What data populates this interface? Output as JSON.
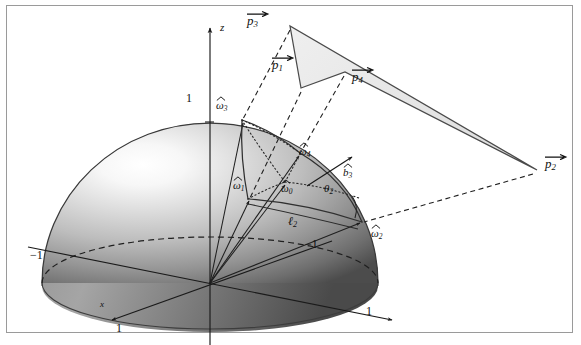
{
  "figure": {
    "kind": "3d-geometry-diagram",
    "border_color": "#9a9a9a",
    "background": "#ffffff",
    "ink_color": "#1a1a1a",
    "sphere": {
      "highlight_color": "#fbfbfb",
      "midtone_color": "#b5b5b5",
      "shadow_color": "#4e4e4e",
      "outline_color": "#3a3a3a"
    },
    "patch": {
      "fill_color": "#e4e4e4",
      "edge_color": "#4a4a4a"
    }
  },
  "axes": {
    "z_label": "z",
    "x_label": "x",
    "ticks": {
      "z_top": "1",
      "x_front": "1",
      "x_back": "−1",
      "y_right": "1",
      "y_left": "−1"
    }
  },
  "labels": {
    "p1": {
      "base": "p",
      "sub": "1",
      "accent": "vec",
      "text": "p⃗1"
    },
    "p2": {
      "base": "p",
      "sub": "2",
      "accent": "vec",
      "text": "p⃗2"
    },
    "p3": {
      "base": "p",
      "sub": "3",
      "accent": "vec",
      "text": "p⃗3"
    },
    "p4": {
      "base": "p",
      "sub": "4",
      "accent": "vec",
      "text": "p⃗4"
    },
    "w0": {
      "base": "ω",
      "sub": "0",
      "accent": "hat",
      "text": "ω̂0"
    },
    "w1": {
      "base": "ω",
      "sub": "1",
      "accent": "hat",
      "text": "ω̂1"
    },
    "w2": {
      "base": "ω",
      "sub": "2",
      "accent": "hat",
      "text": "ω̂2"
    },
    "w3": {
      "base": "ω",
      "sub": "3",
      "accent": "hat",
      "text": "ω̂3"
    },
    "w4": {
      "base": "ω",
      "sub": "4",
      "accent": "hat",
      "text": "ω̂4"
    },
    "b3": {
      "base": "b",
      "sub": "3",
      "accent": "hat",
      "text": "b̂3"
    },
    "theta2": {
      "base": "θ",
      "sub": "2",
      "accent": "none",
      "text": "θ2"
    },
    "ell2": {
      "base": "ℓ",
      "sub": "2",
      "accent": "none",
      "text": "ℓ2"
    }
  },
  "geometry": {
    "origin": [
      210,
      283
    ],
    "sphere_center": [
      210,
      283
    ],
    "sphere_rx": 168,
    "sphere_ry": 160,
    "equator_ry": 46,
    "patch_points": {
      "p3": [
        290,
        26
      ],
      "p1": [
        301,
        88
      ],
      "p4": [
        345,
        72
      ],
      "p2": [
        537,
        170
      ]
    },
    "sphere_points": {
      "w3": [
        242,
        120
      ],
      "w4": [
        300,
        153
      ],
      "w1": [
        248,
        199
      ],
      "w0": [
        285,
        182
      ],
      "w2": [
        362,
        222
      ]
    },
    "b3_tip": [
      356,
      155
    ],
    "axis_z_top": [
      210,
      22
    ],
    "axis_x_front": [
      117,
      317
    ],
    "axis_x_back": [
      330,
      242
    ],
    "axis_y_right": [
      395,
      320
    ],
    "axis_y_left": [
      30,
      248
    ]
  }
}
